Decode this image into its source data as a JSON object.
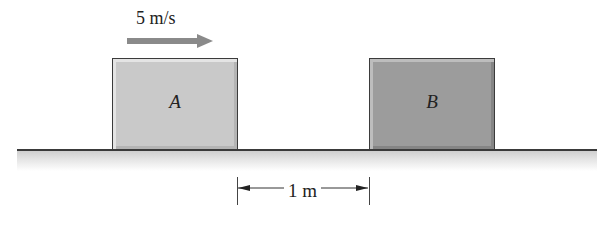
{
  "diagram": {
    "blocks": [
      {
        "id": "A",
        "label": "A",
        "color": "#c9c9c9"
      },
      {
        "id": "B",
        "label": "B",
        "color": "#9c9c9c"
      }
    ],
    "velocity": {
      "label": "5 m/s",
      "direction": "right",
      "applies_to": "A"
    },
    "distance": {
      "label": "1 m",
      "between": [
        "A",
        "B"
      ]
    },
    "ground": {
      "color": "#3a3a3a"
    }
  }
}
